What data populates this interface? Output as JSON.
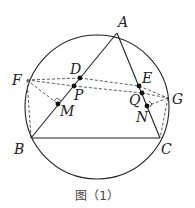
{
  "figure": {
    "caption": "图（1）",
    "top_text_fragment": "",
    "circle": {
      "cx": 97,
      "cy": 107,
      "r": 72
    },
    "points": {
      "A": {
        "label": "A",
        "x": 117,
        "y": 33
      },
      "B": {
        "label": "B",
        "x": 31,
        "y": 138
      },
      "C": {
        "label": "C",
        "x": 160,
        "y": 138
      },
      "D": {
        "label": "D",
        "x": 80,
        "y": 78
      },
      "E": {
        "label": "E",
        "x": 139,
        "y": 86
      },
      "F": {
        "label": "F",
        "x": 27,
        "y": 80
      },
      "G": {
        "label": "G",
        "x": 168,
        "y": 98
      },
      "M": {
        "label": "M",
        "x": 58,
        "y": 104
      },
      "N": {
        "label": "N",
        "x": 147,
        "y": 106
      },
      "P": {
        "label": "P",
        "x": 74,
        "y": 86
      },
      "Q": {
        "label": "Q",
        "x": 142,
        "y": 93
      }
    },
    "solid_segments": [
      "AB",
      "AC",
      "BC"
    ],
    "dashed_segments": [
      "FD",
      "DE",
      "EG",
      "FP",
      "PQ",
      "QG",
      "FM",
      "GN",
      "FB",
      "GC"
    ],
    "right_angle_marks": [
      "M",
      "N"
    ],
    "colors": {
      "stroke": "#222222",
      "caption": "#444444"
    }
  }
}
